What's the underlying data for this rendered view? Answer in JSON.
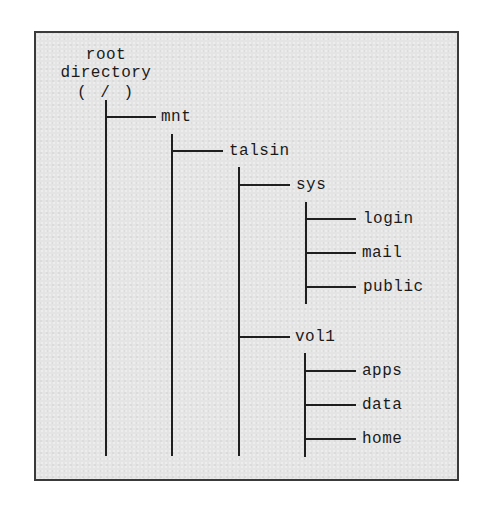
{
  "diagram": {
    "type": "directory-tree",
    "colors": {
      "background": "#e4e4e4",
      "border": "#3a3a3a",
      "lines": "#1f1f1f",
      "text": "#1a1a1a"
    },
    "root": {
      "line1": "root",
      "line2": "directory",
      "line3": "( / )"
    },
    "nodes": {
      "mnt": "mnt",
      "talsin": "talsin",
      "sys": "sys",
      "login": "login",
      "mail": "mail",
      "public": "public",
      "vol1": "vol1",
      "apps": "apps",
      "data": "data",
      "home": "home"
    },
    "structure": {
      "name": "/",
      "children": [
        {
          "name": "mnt",
          "children": [
            {
              "name": "talsin",
              "children": [
                {
                  "name": "sys",
                  "children": [
                    {
                      "name": "login"
                    },
                    {
                      "name": "mail"
                    },
                    {
                      "name": "public"
                    }
                  ]
                },
                {
                  "name": "vol1",
                  "children": [
                    {
                      "name": "apps"
                    },
                    {
                      "name": "data"
                    },
                    {
                      "name": "home"
                    }
                  ]
                }
              ]
            }
          ]
        }
      ]
    }
  }
}
